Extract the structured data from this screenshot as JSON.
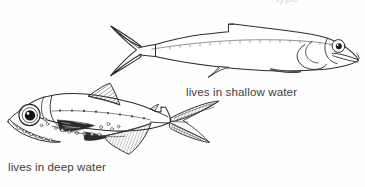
{
  "figure": {
    "type": "scientific-line-drawing",
    "background_color": "#fefefe",
    "ink_color": "#2b2b2b",
    "label_color": "#3c3c3c",
    "clipped_top_text": "type",
    "specimens": [
      {
        "id": "shallow-water-fish",
        "caption": "lives in shallow water",
        "orientation": "faces-right",
        "body": "slender streamlined fusiform body",
        "eye": "small round eye with dark pupil",
        "tail": "deeply forked caudal fin",
        "features": [
          "lateral line with fine tick marks",
          "single small dorsal fin",
          "small pectoral fin",
          "small pelvic fin",
          "operculum arc behind eye",
          "terminal mouth"
        ]
      },
      {
        "id": "deep-water-fish",
        "caption": "lives in deep water",
        "orientation": "faces-left",
        "body": "deep-bodied short trunk tapering to caudal peduncle",
        "eye": "greatly enlarged round eye with large black pupil",
        "tail": "forked caudal fin with hatched rays",
        "features": [
          "large triangular hatched dorsal fin",
          "long hatched anal fin",
          "dark pigmented patch on flank",
          "rows of circular photophores along belly and head",
          "hatched adipose fin",
          "large oblique jaw"
        ]
      }
    ]
  },
  "labels": {
    "shallow": "lives in shallow water",
    "deep": "lives in deep water"
  }
}
